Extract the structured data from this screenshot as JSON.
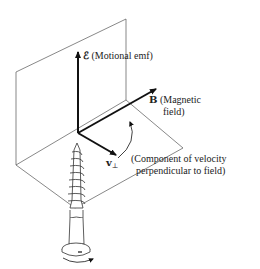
{
  "diagram": {
    "vectors": {
      "emf": {
        "symbol": "ℰ",
        "description": "(Motional emf)"
      },
      "field": {
        "symbol": "B",
        "description_line1": "(Magnetic",
        "description_line2": "field)"
      },
      "velocity": {
        "symbol": "v",
        "subscript": "⊥",
        "description_line1": "(Component of velocity",
        "description_line2": "perpendicular to field)"
      }
    },
    "elements": [
      "vertical-plane",
      "horizontal-plane",
      "emf-arrow",
      "field-arrow",
      "velocity-arrow",
      "rotation-arc-arrow",
      "screw",
      "screw-rotation-arrow"
    ],
    "colors": {
      "stroke": "#111111",
      "plane": "#555555",
      "background": "#ffffff"
    }
  }
}
